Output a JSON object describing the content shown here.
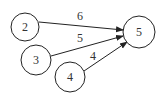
{
  "nodes": [
    {
      "id": "2",
      "label": "2",
      "cx": 25,
      "cy": 27,
      "r": 14
    },
    {
      "id": "3",
      "label": "3",
      "cx": 36,
      "cy": 60,
      "r": 15
    },
    {
      "id": "4",
      "label": "4",
      "cx": 70,
      "cy": 77,
      "r": 15
    },
    {
      "id": "5",
      "label": "5",
      "cx": 139,
      "cy": 32,
      "r": 16
    }
  ],
  "edges": [
    {
      "from": "2",
      "to": "5",
      "label": "6",
      "x1": 39,
      "y1": 22,
      "x2": 123,
      "y2": 30,
      "lx": 80,
      "ly": 20
    },
    {
      "from": "3",
      "to": "5",
      "label": "5",
      "x1": 51,
      "y1": 56,
      "x2": 123,
      "y2": 36,
      "lx": 80,
      "ly": 42
    },
    {
      "from": "4",
      "to": "5",
      "label": "4",
      "x1": 84,
      "y1": 71,
      "x2": 127,
      "y2": 42,
      "lx": 93,
      "ly": 60
    }
  ],
  "colors": {
    "stroke": "#222222",
    "text": "#333333",
    "background": "#ffffff"
  }
}
